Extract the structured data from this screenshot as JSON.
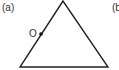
{
  "figure": {
    "panel_a_label": "(a)",
    "panel_b_label": "(b",
    "point_label": "O",
    "shape": "triangle",
    "vertices": [
      [
        63,
        1
      ],
      [
        20,
        67
      ],
      [
        108,
        67
      ]
    ],
    "point": [
      41,
      34
    ],
    "stroke_color": "#222222"
  }
}
